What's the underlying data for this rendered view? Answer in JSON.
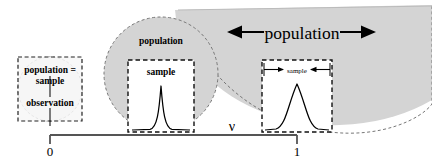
{
  "figure": {
    "title": "",
    "axis": {
      "variable_label": "ν",
      "ticks": [
        {
          "label": "0",
          "x": 50
        },
        {
          "label": "1",
          "x": 297
        }
      ],
      "line_color": "#555555"
    },
    "colors": {
      "population_fill": "#d4d4d4",
      "sample_fill": "#ffffff",
      "outline": "#000000",
      "dashed_outline": "#333333",
      "curve": "#000000",
      "axis": "#555555"
    },
    "groups": [
      {
        "id": "left",
        "position_label": "0",
        "population_shape": "circle",
        "population_label": "",
        "sample_label": "",
        "inner_text_line1": "population =",
        "inner_text_line2": "sample",
        "inner_text_line3": "observation",
        "curve": "none",
        "note": "population equals sample equals a single observation"
      },
      {
        "id": "middle",
        "position_label": "between 0 and 1",
        "population_shape": "circle",
        "population_label": "population",
        "sample_label": "sample",
        "curve": "narrow-gaussian",
        "curve_width_relative": 0.22,
        "note": "sample is a small subset of the population"
      },
      {
        "id": "right",
        "position_label": "1",
        "population_shape": "large-circle-clipped",
        "population_label": "population",
        "sample_label": "sample",
        "curve": "wide-gaussian",
        "curve_width_relative": 0.55,
        "note": "population is very large relative to the sample"
      }
    ],
    "annotations": {
      "population_arrow_label": "population",
      "population_arrow_direction": "outward-double",
      "sample_arrow_label": "sample",
      "sample_arrow_direction": "inward-double"
    }
  }
}
